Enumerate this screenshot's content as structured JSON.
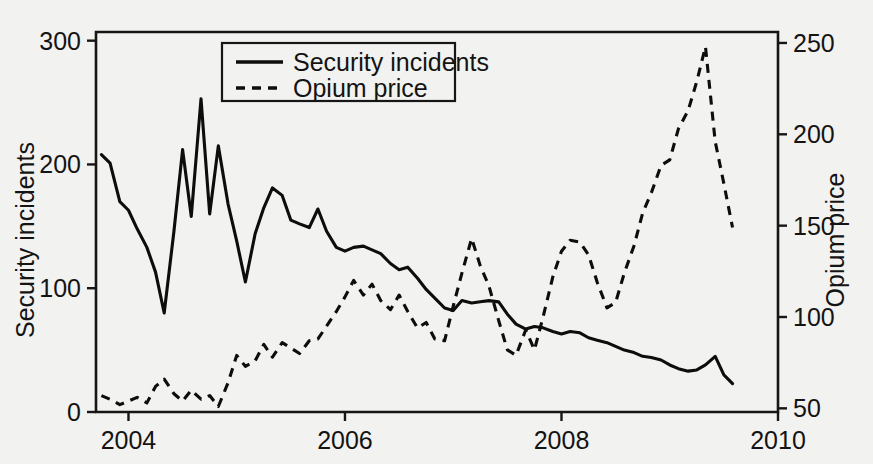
{
  "chart_data": {
    "type": "line",
    "title": "",
    "xlabel": "",
    "ylabel": "Security incidents",
    "y2label": "Opium price",
    "grid": false,
    "legend_position": "top-center",
    "xlim": [
      2003.7,
      2010.0
    ],
    "xticks": [
      2004,
      2006,
      2008,
      2010
    ],
    "xticklabels": [
      "2004",
      "2006",
      "2008",
      "2010"
    ],
    "ylim": [
      0,
      307
    ],
    "yticks": [
      0,
      100,
      200,
      300
    ],
    "yticklabels": [
      "0",
      "100",
      "200",
      "300"
    ],
    "y2lim": [
      48,
      256
    ],
    "y2ticks": [
      50,
      100,
      150,
      200,
      250
    ],
    "y2ticklabels": [
      "50",
      "100",
      "150",
      "200",
      "250"
    ],
    "series": [
      {
        "name": "Security incidents",
        "axis": "left",
        "style": "solid",
        "x": [
          2003.75,
          2003.83,
          2003.92,
          2004.0,
          2004.08,
          2004.17,
          2004.25,
          2004.33,
          2004.42,
          2004.5,
          2004.58,
          2004.67,
          2004.75,
          2004.83,
          2004.92,
          2005.0,
          2005.08,
          2005.17,
          2005.25,
          2005.33,
          2005.42,
          2005.5,
          2005.58,
          2005.67,
          2005.75,
          2005.83,
          2005.92,
          2006.0,
          2006.08,
          2006.17,
          2006.25,
          2006.33,
          2006.42,
          2006.5,
          2006.58,
          2006.67,
          2006.75,
          2006.83,
          2006.92,
          2007.0,
          2007.08,
          2007.17,
          2007.25,
          2007.33,
          2007.42,
          2007.5,
          2007.58,
          2007.67,
          2007.75,
          2007.83,
          2007.92,
          2008.0,
          2008.08,
          2008.17,
          2008.25,
          2008.33,
          2008.42,
          2008.5,
          2008.58,
          2008.67,
          2008.75,
          2008.83,
          2008.92,
          2009.0,
          2009.08,
          2009.17,
          2009.25,
          2009.33,
          2009.42,
          2009.5,
          2009.58
        ],
        "values": [
          208,
          201,
          170,
          163,
          148,
          133,
          113,
          80,
          146,
          212,
          158,
          253,
          160,
          215,
          168,
          138,
          105,
          144,
          165,
          181,
          175,
          155,
          152,
          149,
          164,
          146,
          133,
          130,
          133,
          134,
          131,
          128,
          120,
          115,
          117,
          108,
          99,
          92,
          84,
          82,
          90,
          88,
          89,
          90,
          89,
          79,
          71,
          67,
          69,
          68,
          65,
          63,
          65,
          64,
          60,
          58,
          56,
          53,
          50,
          48,
          45,
          44,
          42,
          38,
          35,
          33,
          34,
          38,
          45,
          30,
          23
        ]
      },
      {
        "name": "Opium price",
        "axis": "right",
        "style": "dashed",
        "x": [
          2003.75,
          2003.83,
          2003.92,
          2004.0,
          2004.08,
          2004.17,
          2004.25,
          2004.33,
          2004.42,
          2004.5,
          2004.58,
          2004.67,
          2004.75,
          2004.83,
          2004.92,
          2005.0,
          2005.08,
          2005.17,
          2005.25,
          2005.33,
          2005.42,
          2005.5,
          2005.58,
          2005.67,
          2005.75,
          2005.83,
          2005.92,
          2006.0,
          2006.08,
          2006.17,
          2006.25,
          2006.33,
          2006.42,
          2006.5,
          2006.58,
          2006.67,
          2006.75,
          2006.83,
          2006.92,
          2007.0,
          2007.08,
          2007.17,
          2007.25,
          2007.33,
          2007.42,
          2007.5,
          2007.58,
          2007.67,
          2007.75,
          2007.83,
          2007.92,
          2008.0,
          2008.08,
          2008.17,
          2008.25,
          2008.33,
          2008.42,
          2008.5,
          2008.58,
          2008.67,
          2008.75,
          2008.83,
          2008.92,
          2009.0,
          2009.08,
          2009.17,
          2009.25,
          2009.33,
          2009.42,
          2009.5,
          2009.58
        ],
        "values": [
          57,
          55,
          52,
          54,
          56,
          53,
          62,
          66,
          58,
          54,
          60,
          55,
          57,
          51,
          64,
          79,
          73,
          76,
          85,
          78,
          86,
          83,
          80,
          87,
          88,
          95,
          103,
          111,
          120,
          112,
          118,
          109,
          104,
          112,
          103,
          94,
          97,
          88,
          87,
          106,
          124,
          143,
          128,
          117,
          98,
          82,
          79,
          93,
          82,
          100,
          122,
          136,
          142,
          141,
          134,
          119,
          105,
          108,
          124,
          139,
          157,
          168,
          183,
          186,
          203,
          213,
          229,
          248,
          196,
          173,
          149
        ]
      }
    ]
  },
  "legend": {
    "items": [
      {
        "label": "Security incidents",
        "style": "solid"
      },
      {
        "label": "Opium price",
        "style": "dashed"
      }
    ]
  },
  "axes": {
    "left_title": "Security incidents",
    "right_title": "Opium price"
  },
  "colors": {
    "line": "#0d0d0d",
    "axis": "#161616",
    "background": "#f2f2f0",
    "text": "#141414"
  }
}
